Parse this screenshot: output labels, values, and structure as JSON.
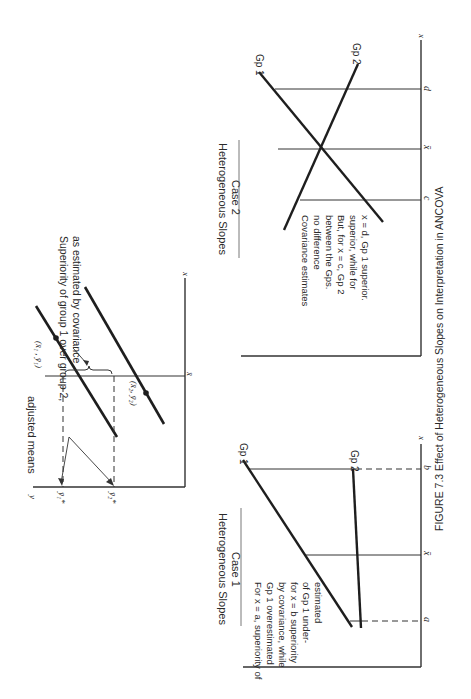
{
  "figure": {
    "caption": "FIGURE 7.3   Effect of Heterogeneous Slopes on Interpretation in ANCOVA",
    "orientation": "rotated 90 degrees clockwise"
  },
  "panel_top": {
    "y_axis_label": "y",
    "x_axis_label": "x",
    "xbar_label": "x̄",
    "adjusted_means_label": "adjusted means",
    "y1_adj_label": "ȳ₁*",
    "y2_adj_label": "ȳ₂*",
    "point1_label": "(x̄₁ , ȳ₁)",
    "point2_label": "(x̄₂, ȳ₂)",
    "brace_note_line1": "Superiority of group 1 over group 2,",
    "brace_note_line2": "as estimated by covariance"
  },
  "panel_case1": {
    "title_line1": "Heterogeneous Slopes",
    "title_line2": "Case 1",
    "x_axis_label": "x",
    "tick_a": "a",
    "tick_xbar": "x̄",
    "tick_b": "b",
    "gp1_label": "Gp 1",
    "gp2_label": "Gp 2",
    "note_lines": [
      "For x  =  a, superiority of",
      "Gp 1 overestimated",
      "by covariance, while",
      "for x  =  b superiority",
      "of Gp 1 under-",
      "estimated"
    ]
  },
  "panel_case2": {
    "title_line1": "Heterogeneous Slopes",
    "title_line2": "Case 2",
    "x_axis_label": "x",
    "tick_c": "c",
    "tick_xbar": "x̄",
    "tick_d": "d",
    "gp1_label": "Gp 1",
    "gp2_label": "Gp 2",
    "note_lines": [
      "Covariance estimates",
      "no difference",
      "between the Gps.",
      "But, for x  =  c, Gp 2",
      "superior, while for",
      "x  =  d, Gp 1 superior."
    ]
  }
}
